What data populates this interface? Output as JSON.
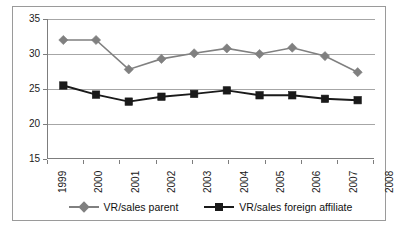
{
  "chart_data": {
    "type": "line",
    "title": "",
    "subtitle": "",
    "xlabel": "",
    "ylabel": "",
    "categories": [
      "1999",
      "2000",
      "2001",
      "2002",
      "2003",
      "2004",
      "2005",
      "2006",
      "2007",
      "2008"
    ],
    "series": [
      {
        "name": "VR/sales parent",
        "color": "#808080",
        "marker": "diamond",
        "values": [
          32.0,
          32.0,
          27.8,
          29.3,
          30.1,
          30.8,
          30.0,
          30.9,
          29.7,
          27.4
        ]
      },
      {
        "name": "VR/sales foreign affiliate",
        "color": "#1a1a1a",
        "marker": "square",
        "values": [
          25.5,
          24.2,
          23.2,
          23.9,
          24.3,
          24.8,
          24.1,
          24.1,
          23.6,
          23.4
        ]
      }
    ],
    "ylim": [
      15,
      35
    ],
    "yticks": [
      15,
      20,
      25,
      30,
      35
    ],
    "ytick_labels": [
      "15",
      "20",
      "25",
      "30",
      "35"
    ],
    "grid": true,
    "grid_axis": "y",
    "legend_position": "bottom",
    "xtick_label_rotation": -90
  },
  "axes": {
    "y_axis_name": "value-axis",
    "x_axis_name": "year-axis"
  },
  "legend": {
    "entries": [
      {
        "label": "VR/sales parent",
        "marker": "diamond-marker-icon",
        "color": "#808080"
      },
      {
        "label": "VR/sales foreign affiliate",
        "marker": "square-marker-icon",
        "color": "#1a1a1a"
      }
    ]
  }
}
